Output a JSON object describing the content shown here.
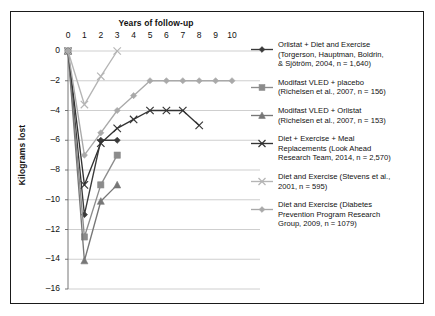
{
  "chart_data": {
    "type": "line",
    "title": "",
    "xlabel": "Years of follow-up",
    "ylabel": "Kilograms lost",
    "xlim": [
      0,
      10
    ],
    "ylim": [
      -16,
      0
    ],
    "xticks": [
      "0",
      "1",
      "2",
      "3",
      "4",
      "5",
      "6",
      "7",
      "8",
      "9",
      "10"
    ],
    "yticks": [
      "0",
      "-2",
      "-4",
      "-6",
      "-8",
      "-10",
      "-12",
      "-14",
      "-16"
    ],
    "grid": "horizontal",
    "legend_position": "right",
    "series": [
      {
        "name": "Orlistat + Diet and Exercise",
        "label_lines": [
          "Orlistat + Diet and Exercise",
          "(Torgerson, Hauptman, Boldrin,",
          "& Sjötröm, 2004, n = 1,640)"
        ],
        "marker": "diamond",
        "color": "#3a3a3a",
        "x": [
          0,
          1,
          2,
          3
        ],
        "values": [
          0,
          -11.0,
          -6.0,
          -6.0
        ]
      },
      {
        "name": "Modifast VLED + placebo",
        "label_lines": [
          "Modifast VLED + placebo",
          "(Richelsen et al., 2007, n = 156)"
        ],
        "marker": "square",
        "color": "#8c8c8c",
        "x": [
          0,
          1,
          2,
          3
        ],
        "values": [
          0,
          -12.5,
          -9.0,
          -7.0
        ]
      },
      {
        "name": "Modifast VLED + Orlistat",
        "label_lines": [
          "Modifast VLED + Orlistat",
          "(Richelsen et al., 2007, n = 153)"
        ],
        "marker": "triangle",
        "color": "#777777",
        "x": [
          0,
          1,
          2,
          3
        ],
        "values": [
          0,
          -14.1,
          -10.1,
          -9.0
        ]
      },
      {
        "name": "Diet + Exercise + Meal Replacements",
        "label_lines": [
          "Diet + Exercise + Meal",
          "Replacements (Look Ahead",
          "Research Team, 2014, n = 2,570)"
        ],
        "marker": "x",
        "color": "#333333",
        "x": [
          0,
          1,
          2,
          3,
          4,
          5,
          6,
          7,
          8
        ],
        "values": [
          0,
          -9.0,
          -6.2,
          -5.2,
          -4.6,
          -4.0,
          -4.0,
          -4.0,
          -5.0
        ]
      },
      {
        "name": "Diet and Exercise (Stevens)",
        "label_lines": [
          "Diet and Exercise (Stevens et al.,",
          "2001, n = 595)"
        ],
        "marker": "x",
        "color": "#b5b5b5",
        "x": [
          0,
          1,
          2,
          3
        ],
        "values": [
          0,
          -3.6,
          -1.7,
          0
        ]
      },
      {
        "name": "Diet and Exercise (Diabetes Prevention Program)",
        "label_lines": [
          "Diet and Exercise (Diabetes",
          "Prevention Program Research",
          "Group, 2009, n = 1079)"
        ],
        "marker": "diamond",
        "color": "#a9a9a9",
        "x": [
          0,
          1,
          2,
          3,
          4,
          5,
          6,
          7,
          8,
          9,
          10
        ],
        "values": [
          0,
          -7.0,
          -5.5,
          -4.0,
          -3.0,
          -2.0,
          -2.0,
          -2.0,
          -2.0,
          -2.0,
          -2.0
        ]
      }
    ]
  }
}
